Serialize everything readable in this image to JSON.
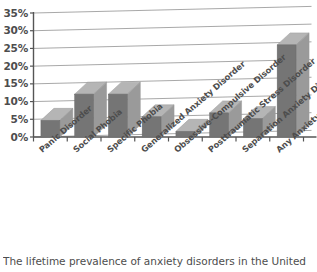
{
  "caption": {
    "text": "The lifetime prevalence of anxiety disorders in the United"
  },
  "chart_data": {
    "type": "bar",
    "title": "",
    "xlabel": "",
    "ylabel": "",
    "categories": [
      "Panic Disorder",
      "Social Phobia",
      "Specific Phobia",
      "Generalized Anxiety Disorder",
      "Obsessive-Compulsive Disorder",
      "Posttraumatic Stress Disorder",
      "Separation Anxiety Disorder",
      "Any Anxiety Disorder"
    ],
    "values": [
      4.7,
      12.1,
      12.1,
      5.7,
      1.6,
      6.8,
      5.2,
      26.0
    ],
    "value_unit": "%",
    "ylim": [
      0,
      35
    ],
    "ytick_values": [
      0,
      5,
      10,
      15,
      20,
      25,
      30,
      35
    ],
    "ytick_labels": [
      "0%",
      "5%",
      "10%",
      "15%",
      "20%",
      "25%",
      "30%",
      "35%"
    ],
    "grid": true,
    "grid_axis": "y",
    "legend": false,
    "style_3d": true,
    "colors": {
      "bar_front": "#757575",
      "bar_top": "#b5b5b5",
      "bar_side": "#9a9a9a",
      "gridline": "#9e9e9e",
      "axis": "#555555",
      "background": "#ffffff",
      "text": "#4d4d4d"
    }
  }
}
